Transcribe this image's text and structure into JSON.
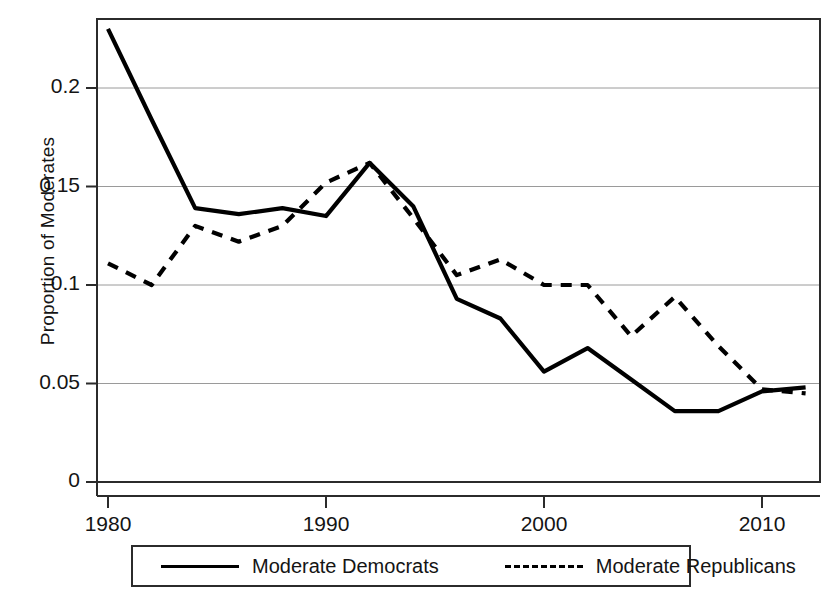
{
  "chart_data": {
    "type": "line",
    "title": "",
    "xlabel": "",
    "ylabel": "Proportion of Moderates",
    "xlim": [
      1980,
      2012
    ],
    "ylim": [
      0,
      0.235
    ],
    "grid": true,
    "xticks": [
      1980,
      1990,
      2000,
      2010
    ],
    "xtick_labels": [
      "1980",
      "1990",
      "2000",
      "2010"
    ],
    "yticks": [
      0,
      0.05,
      0.1,
      0.15,
      0.2
    ],
    "ytick_labels": [
      "0",
      "0.05",
      "0.1",
      "0.15",
      "0.2"
    ],
    "legend_position": "below-plot",
    "x": [
      1980,
      1982,
      1984,
      1986,
      1988,
      1990,
      1992,
      1994,
      1996,
      1998,
      2000,
      2002,
      2004,
      2006,
      2008,
      2010,
      2012
    ],
    "series": [
      {
        "name": "Moderate Democrats",
        "style": "solid",
        "color": "#000000",
        "values": [
          0.23,
          0.184,
          0.139,
          0.136,
          0.139,
          0.135,
          0.162,
          0.14,
          0.093,
          0.083,
          0.056,
          0.068,
          0.052,
          0.036,
          0.036,
          0.046,
          0.048
        ]
      },
      {
        "name": "Moderate Republicans",
        "style": "dashed",
        "color": "#000000",
        "values": [
          0.111,
          0.1,
          0.13,
          0.122,
          0.13,
          0.152,
          0.162,
          0.134,
          0.105,
          0.113,
          0.1,
          0.1,
          0.074,
          0.094,
          0.069,
          0.047,
          0.045
        ]
      }
    ]
  },
  "legend": {
    "entries": [
      {
        "label": "Moderate Democrats",
        "style": "solid"
      },
      {
        "label": "Moderate Republicans",
        "style": "dashed"
      }
    ]
  }
}
